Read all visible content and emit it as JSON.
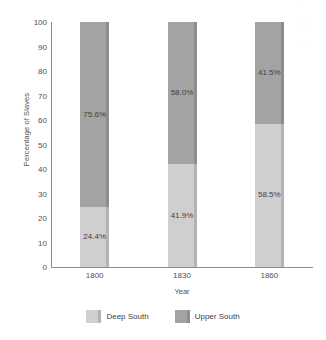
{
  "chart_data": {
    "type": "bar",
    "subtype": "stacked-100-percent",
    "title": "",
    "xlabel": "Year",
    "ylabel": "Percentage of Slaves",
    "categories": [
      "1800",
      "1830",
      "1860"
    ],
    "ylim": [
      0,
      100
    ],
    "yticks": [
      0,
      10,
      20,
      30,
      40,
      50,
      60,
      70,
      80,
      90,
      100
    ],
    "ytick_labels": [
      "0",
      "10",
      "20",
      "30",
      "40",
      "50",
      "60",
      "70",
      "80",
      "90",
      "100"
    ],
    "grid": false,
    "legend_position": "bottom",
    "series": [
      {
        "name": "Deep South",
        "color": "#cfcfcf",
        "values": [
          24.4,
          41.9,
          58.5
        ],
        "labels": [
          "24.4%",
          "41.9%",
          "58.5%"
        ]
      },
      {
        "name": "Upper South",
        "color": "#a3a3a3",
        "values": [
          75.6,
          58.0,
          41.5
        ],
        "labels": [
          "75.6%",
          "58.0%",
          "41.5%"
        ]
      }
    ]
  },
  "colors": {
    "deep_south": "#cfcfcf",
    "upper_south": "#a3a3a3",
    "axis": "#8d8d8d",
    "text": "#4f4f4f",
    "background": "#ffffff"
  }
}
